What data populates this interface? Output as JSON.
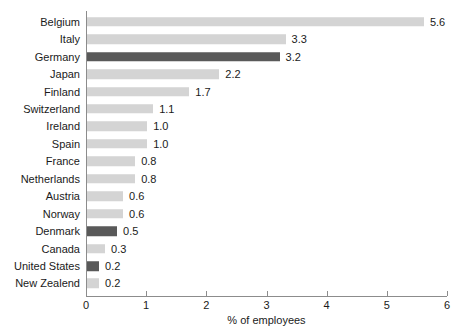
{
  "chart_data": {
    "type": "bar",
    "orientation": "horizontal",
    "title": "",
    "xlabel": "% of employees",
    "ylabel": "",
    "xlim": [
      0,
      6
    ],
    "xticks": [
      "0",
      "1",
      "2",
      "3",
      "4",
      "5",
      "6"
    ],
    "grid": false,
    "legend": null,
    "categories": [
      "Belgium",
      "Italy",
      "Germany",
      "Japan",
      "Finland",
      "Switzerland",
      "Ireland",
      "Spain",
      "France",
      "Netherlands",
      "Austria",
      "Norway",
      "Denmark",
      "Canada",
      "United States",
      "New Zealend"
    ],
    "values": [
      5.6,
      3.3,
      3.2,
      2.2,
      1.7,
      1.1,
      1.0,
      1.0,
      0.8,
      0.8,
      0.6,
      0.6,
      0.5,
      0.3,
      0.2,
      0.2
    ],
    "value_labels": [
      "5.6",
      "3.3",
      "3.2",
      "2.2",
      "1.7",
      "1.1",
      "1.0",
      "1.0",
      "0.8",
      "0.8",
      "0.6",
      "0.6",
      "0.5",
      "0.3",
      "0.2",
      "0.2"
    ],
    "bar_styles": [
      "light",
      "light",
      "dark",
      "light",
      "light",
      "light",
      "light",
      "light",
      "light",
      "light",
      "light",
      "light",
      "dark",
      "light",
      "dark",
      "light"
    ],
    "colors": {
      "bar_light": "#d4d4d4",
      "bar_dark": "#595959",
      "axis": "#8c8c8c",
      "text": "#1a1a1a",
      "background": "#ffffff"
    }
  }
}
